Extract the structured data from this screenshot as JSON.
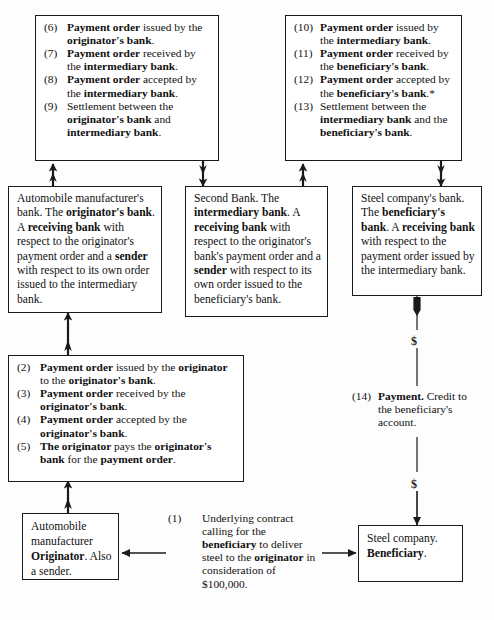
{
  "diagram": {
    "currency_marker": "$"
  },
  "boxes": {
    "steps_6_9": {
      "name": "payment-order-steps-6-9",
      "items": [
        {
          "num": "(6)",
          "strong1": "Payment order",
          "plain1": " issued by the ",
          "strong2": "originator's bank",
          "plain2": "."
        },
        {
          "num": "(7)",
          "strong1": "Payment order",
          "plain1": " received by the ",
          "strong2": "intermediary bank",
          "plain2": "."
        },
        {
          "num": "(8)",
          "strong1": "Payment order",
          "plain1": " accepted by the ",
          "strong2": "intermediary bank",
          "plain2": "."
        },
        {
          "num": "(9)",
          "strong1": "",
          "plain1": "Settlement between the ",
          "strong2": "originator's bank",
          "plain2": " and ",
          "strong3": "intermediary bank",
          "plain3": "."
        }
      ]
    },
    "steps_10_13": {
      "name": "payment-order-steps-10-13",
      "items": [
        {
          "num": "(10)",
          "strong1": "Payment order",
          "plain1": " issued by the ",
          "strong2": "intermediary bank",
          "plain2": "."
        },
        {
          "num": "(11)",
          "strong1": "Payment order",
          "plain1": " received by the ",
          "strong2": "beneficiary's bank",
          "plain2": "."
        },
        {
          "num": "(12)",
          "strong1": "Payment order",
          "plain1": " accepted by the ",
          "strong2": "beneficiary's bank",
          "plain2": ".*"
        },
        {
          "num": "(13)",
          "strong1": "",
          "plain1": "Settlement between the ",
          "strong2": "intermediary bank",
          "plain2": " and the ",
          "strong3": "beneficiary's bank",
          "plain3": "."
        }
      ]
    },
    "steps_2_5": {
      "name": "payment-order-steps-2-5",
      "items": [
        {
          "num": "(2)",
          "strong1": "Payment order",
          "plain1": " issued by the ",
          "strong2": "originator",
          "plain2": " to the ",
          "strong3": "originator's bank",
          "plain3": "."
        },
        {
          "num": "(3)",
          "strong1": "Payment order",
          "plain1": " received by the ",
          "strong2": "originator's bank",
          "plain2": "."
        },
        {
          "num": "(4)",
          "strong1": "Payment order",
          "plain1": " accepted by the ",
          "strong2": "originator's bank",
          "plain2": "."
        },
        {
          "num": "(5)",
          "strong1": "The originator",
          "plain1": " pays the ",
          "strong2": "originator's bank",
          "plain2": " for the ",
          "strong3": "payment order",
          "plain3": "."
        }
      ]
    },
    "originators_bank": {
      "name": "originators-bank-box",
      "segments": [
        {
          "text": "Automobile manufacturer's bank. The ",
          "bold": false
        },
        {
          "text": "originator's bank",
          "bold": true
        },
        {
          "text": ". A ",
          "bold": false
        },
        {
          "text": "receiving bank",
          "bold": true
        },
        {
          "text": " with respect to the originator's payment order and a ",
          "bold": false
        },
        {
          "text": "sender",
          "bold": true
        },
        {
          "text": " with respect to its own order issued to the intermediary bank.",
          "bold": false
        }
      ]
    },
    "intermediary_bank": {
      "name": "intermediary-bank-box",
      "segments": [
        {
          "text": "Second Bank. The ",
          "bold": false
        },
        {
          "text": "intermediary bank",
          "bold": true
        },
        {
          "text": ". A ",
          "bold": false
        },
        {
          "text": "receiving bank",
          "bold": true
        },
        {
          "text": " with respect to the originator's bank's payment order and a ",
          "bold": false
        },
        {
          "text": "sender",
          "bold": true
        },
        {
          "text": " with respect to its own order issued to the beneficiary's bank.",
          "bold": false
        }
      ]
    },
    "beneficiarys_bank": {
      "name": "beneficiarys-bank-box",
      "segments": [
        {
          "text": "Steel company's bank. The ",
          "bold": false
        },
        {
          "text": "beneficiary's bank",
          "bold": true
        },
        {
          "text": ". A ",
          "bold": false
        },
        {
          "text": "receiving bank",
          "bold": true
        },
        {
          "text": " with respect to the payment order issued by the intermediary bank.",
          "bold": false
        }
      ]
    },
    "originator": {
      "name": "originator-box",
      "segments": [
        {
          "text": "Automobile manufacturer ",
          "bold": false
        },
        {
          "text": "Originator",
          "bold": true
        },
        {
          "text": ". Also a sender.",
          "bold": false
        }
      ]
    },
    "beneficiary": {
      "name": "beneficiary-box",
      "segments": [
        {
          "text": "Steel company. ",
          "bold": false
        },
        {
          "text": "Beneficiary",
          "bold": true
        },
        {
          "text": ".",
          "bold": false
        }
      ]
    }
  },
  "notes": {
    "step_14": {
      "num": "(14)",
      "strong1": "Payment.",
      "plain1": " Credit to the beneficiary's account."
    },
    "step_1": {
      "num": "(1)",
      "strong1": "",
      "plain1": "Underlying contract calling for the ",
      "strong2": "beneficiary",
      "plain2": " to deliver steel to the ",
      "strong3": "originator",
      "plain3": " in consideration of $100,000."
    }
  },
  "labels": {
    "dollar_top": "$",
    "dollar_bottom": "$"
  },
  "colors": {
    "ink": "#1a1a1a",
    "paper": "#fdfdfd"
  }
}
